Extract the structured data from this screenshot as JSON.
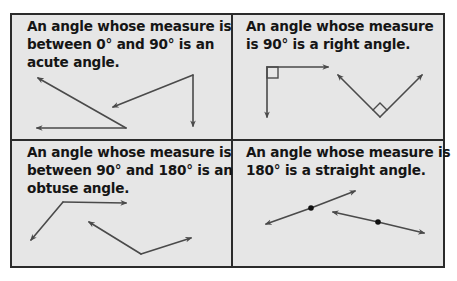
{
  "panels": [
    {
      "id": "acute",
      "text": "An angle whose measure is\nbetween 0° and 90° is an\nacute angle."
    },
    {
      "id": "right",
      "text": "An angle whose measure\nis 90° is a right angle."
    },
    {
      "id": "obtuse",
      "text": "An angle whose measure is\nbetween 90° and 180° is an\nobtuse angle."
    },
    {
      "id": "straight",
      "text": "An angle whose measure is\n180° is a straight angle."
    }
  ],
  "colors": {
    "panel_background": "#e6e6e6",
    "border": "#2b2b2b",
    "ray": "#4a4a4a",
    "text": "#151515"
  }
}
